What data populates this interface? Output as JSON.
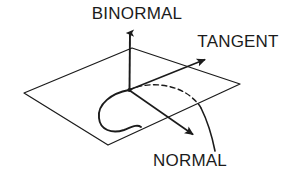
{
  "figure": {
    "name": "frenet-frame-diagram",
    "background_color": "#ffffff",
    "stroke_color": "#1b1b1b",
    "text_color": "#1b1b1b",
    "width": 294,
    "height": 175
  },
  "labels": {
    "binormal": "BINORMAL",
    "tangent": "TANGENT",
    "normal": "NORMAL"
  },
  "geometry": {
    "origin": {
      "x": 129,
      "y": 90
    },
    "plane": {
      "name": "osculating-plane",
      "corners": [
        {
          "x": 132,
          "y": 48
        },
        {
          "x": 240,
          "y": 84
        },
        {
          "x": 108,
          "y": 145
        },
        {
          "x": 24,
          "y": 93
        }
      ]
    },
    "vectors": [
      {
        "name": "binormal-vector",
        "from": {
          "x": 129,
          "y": 90
        },
        "to": {
          "x": 130,
          "y": 28
        }
      },
      {
        "name": "tangent-vector",
        "from": {
          "x": 129,
          "y": 90
        },
        "to": {
          "x": 208,
          "y": 58
        }
      },
      {
        "name": "normal-vector",
        "from": {
          "x": 129,
          "y": 90
        },
        "to": {
          "x": 196,
          "y": 137
        }
      }
    ],
    "curve": {
      "name": "space-curve",
      "solid_segment": "M129,90 C 112,93 97,104 99,118 C 100,130 112,134 124,130 C 132,127 137,124 141,127",
      "dashed_segment": "M129,90 C 148,81 175,84 190,96 C 196,101 199,104 201,108",
      "falling_segment": "M201,108 C 207,120 212,136 215,151"
    }
  },
  "label_positions": {
    "binormal": {
      "x": 137,
      "y": 19,
      "anchor": "middle"
    },
    "tangent": {
      "x": 238,
      "y": 47,
      "anchor": "middle"
    },
    "normal": {
      "x": 190,
      "y": 166,
      "anchor": "middle"
    }
  }
}
